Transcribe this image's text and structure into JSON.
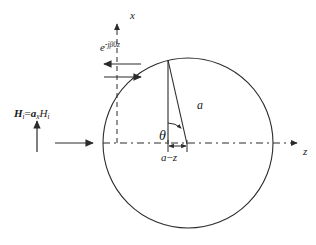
{
  "figure": {
    "background_color": "#ffffff",
    "line_color": "#2b2b2b",
    "text_color": "#1a1a1a",
    "width": 316,
    "height": 245
  },
  "axes": {
    "x": {
      "label": "x",
      "style": "dashed",
      "orientation": "vertical",
      "arrow": "up",
      "x": 117,
      "from_y": 143,
      "to_y": 22
    },
    "z": {
      "label": "z",
      "style": "dash-dot",
      "orientation": "horizontal",
      "arrow": "right",
      "y": 143,
      "from_x": 103,
      "to_x": 300
    },
    "origin_note": "axes cross at the left edge of the circle"
  },
  "circle": {
    "name": "sphere-cross-section",
    "center_x": 188,
    "center_y": 143,
    "radius": 85,
    "stroke": "#2b2b2b",
    "stroke_width": 1.1
  },
  "incident_field": {
    "label_parts": {
      "h_bold": "H",
      "h_sub": "i",
      "equals": "=",
      "unit_vector": "a",
      "unit_sub": "x",
      "magnitude": "H",
      "magnitude_sub": "i"
    },
    "label_plain": "Hi = âx Hi",
    "arrow": {
      "name": "incident-field-arrow",
      "direction": "up",
      "x": 37,
      "from_y": 152,
      "to_y": 120
    }
  },
  "wave_arrows": {
    "exponential_label": {
      "base": "e",
      "exponent": "-jβ0z",
      "plain": "e^{-jβ0z}"
    },
    "left_arrow": {
      "name": "wave-arrow-left",
      "direction": "left",
      "y": 64,
      "from_x": 140,
      "to_x": 103
    },
    "right_arrow": {
      "name": "wave-arrow-right",
      "direction": "right",
      "y": 76,
      "from_x": 103,
      "to_x": 140
    }
  },
  "construction": {
    "apex": {
      "x": 168,
      "y": 60,
      "note": "point on circle where chord lines meet"
    },
    "vertical_drop": {
      "name": "vertical-drop-line",
      "from": {
        "x": 168,
        "y": 60
      },
      "to": {
        "x": 168,
        "y": 143
      }
    },
    "radius_line": {
      "name": "radius-line",
      "label": "a",
      "from": {
        "x": 168,
        "y": 60
      },
      "to": {
        "x": 187,
        "y": 143
      }
    },
    "angle": {
      "name": "theta-angle",
      "label": "θ",
      "vertex": {
        "x": 168,
        "y": 143
      },
      "between": [
        "vertical-drop-line",
        "radius-line"
      ]
    },
    "dimension": {
      "name": "a-minus-z-dimension",
      "label": "a−z",
      "label_parts": {
        "a": "a",
        "minus": "−",
        "z": "z"
      },
      "y": 146,
      "from_x": 168,
      "to_x": 187
    }
  }
}
